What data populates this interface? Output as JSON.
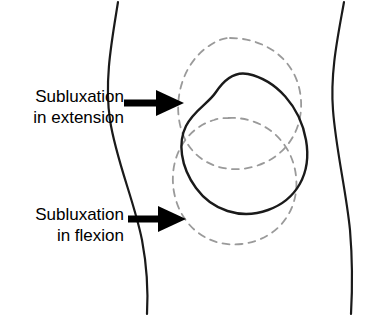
{
  "figure": {
    "type": "anatomical-diagram",
    "background_color": "#ffffff",
    "line_color": "#1a1a1a",
    "dashed_color": "#9a9a9a"
  },
  "labels": {
    "extension": {
      "line1": "Subluxation",
      "line2": "in extension"
    },
    "flexion": {
      "line1": "Subluxation",
      "line2": "in flexion"
    }
  },
  "arrows": [
    {
      "name": "arrow-extension",
      "points_to": "upper patella position"
    },
    {
      "name": "arrow-flexion",
      "points_to": "lower patella position"
    }
  ],
  "shapes": [
    {
      "name": "knee-outline-left",
      "style": "solid"
    },
    {
      "name": "knee-outline-right",
      "style": "solid"
    },
    {
      "name": "patella-solid",
      "style": "solid"
    },
    {
      "name": "patella-dashed-upper",
      "style": "dashed"
    },
    {
      "name": "patella-dashed-lower",
      "style": "dashed"
    }
  ]
}
